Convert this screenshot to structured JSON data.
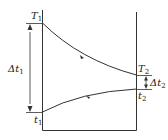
{
  "diagram": {
    "colors": {
      "stroke": "#333333",
      "text": "#222222",
      "background": "#ffffff"
    },
    "labels": {
      "T1": {
        "main": "T",
        "sub": "1"
      },
      "T2": {
        "main": "T",
        "sub": "2"
      },
      "t1": {
        "main": "t",
        "sub": "1"
      },
      "t2": {
        "main": "t",
        "sub": "2"
      },
      "dt1": {
        "main": "Δt",
        "sub": "1"
      },
      "dt2": {
        "main": "Δt",
        "sub": "2"
      }
    },
    "curves": [
      {
        "name": "hot-fluid",
        "from": "T1",
        "to": "T2",
        "direction": "left-to-right"
      },
      {
        "name": "cold-fluid",
        "from": "t1",
        "to": "t2",
        "direction": "left-to-right"
      }
    ]
  }
}
